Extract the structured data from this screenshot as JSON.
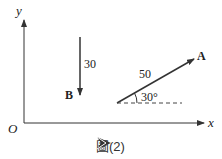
{
  "diagram": {
    "axes": {
      "x_label": "x",
      "y_label": "y",
      "origin_label": "O"
    },
    "vectors": [
      {
        "name": "A",
        "magnitude_label": "50",
        "angle_label": "30°",
        "direction": "up-right at 30° from horizontal"
      },
      {
        "name": "B",
        "magnitude_label": "30",
        "direction": "straight down"
      }
    ],
    "colors": {
      "line": "#333333",
      "text": "#222222",
      "dashed": "#444444"
    }
  },
  "caption": {
    "icon": "arrow-pointer-icon",
    "text": "圖(2)"
  }
}
